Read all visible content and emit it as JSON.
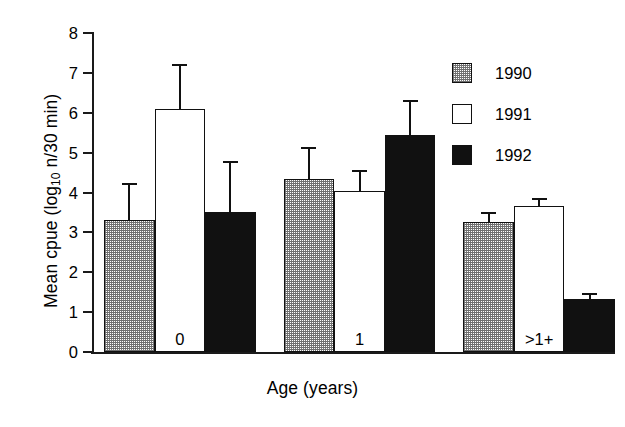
{
  "chart_data": {
    "type": "bar",
    "title": "",
    "xlabel": "Age (years)",
    "ylabel": "Mean cpue (log10 n/30 min)",
    "ylabel_main": "Mean cpue (log",
    "ylabel_sub": "10",
    "ylabel_tail": " n/30 min)",
    "categories": [
      "0",
      "1",
      ">1+"
    ],
    "ylim": [
      0,
      8
    ],
    "yticks": [
      0,
      1,
      2,
      3,
      4,
      5,
      6,
      7,
      8
    ],
    "ytick_labels": [
      "0",
      "1",
      "2",
      "3",
      "4",
      "5",
      "6",
      "7",
      "8"
    ],
    "grid": false,
    "legend_position": "top-right",
    "error_bar_type": "upper-only",
    "series": [
      {
        "name": "1990",
        "fill": "stipple-gray",
        "color": "#808080",
        "values": [
          3.32,
          4.33,
          3.27
        ],
        "errors": [
          0.93,
          0.82,
          0.25
        ]
      },
      {
        "name": "1991",
        "fill": "white",
        "color": "#ffffff",
        "values": [
          6.1,
          4.05,
          3.65
        ],
        "errors": [
          1.12,
          0.52,
          0.22
        ]
      },
      {
        "name": "1992",
        "fill": "black",
        "color": "#111111",
        "values": [
          3.52,
          5.43,
          1.32
        ],
        "errors": [
          1.28,
          0.9,
          0.17
        ]
      }
    ]
  },
  "legend": {
    "items": [
      {
        "label": "1990"
      },
      {
        "label": "1991"
      },
      {
        "label": "1992"
      }
    ]
  }
}
